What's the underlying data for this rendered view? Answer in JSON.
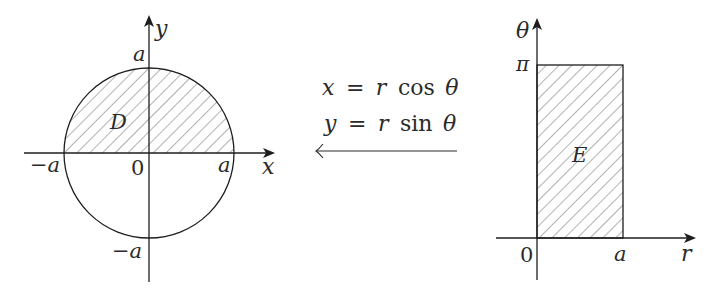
{
  "left_diagram": {
    "region_label": "D",
    "x_axis_label": "x",
    "y_axis_label": "y",
    "origin_label": "0",
    "tick_labels": {
      "x_pos": "a",
      "x_neg": "−a",
      "y_pos": "a",
      "y_neg": "−a"
    },
    "description": "Disk of radius a centered at origin; upper half (y ≥ 0) shaded"
  },
  "transform": {
    "eq1": {
      "lhs": "x",
      "rhs_var": "r",
      "func": "cos",
      "angle": "θ"
    },
    "eq2": {
      "lhs": "y",
      "rhs_var": "r",
      "func": "sin",
      "angle": "θ"
    },
    "equals": "=",
    "arrow_direction": "left"
  },
  "right_diagram": {
    "region_label": "E",
    "x_axis_label": "r",
    "y_axis_label": "θ",
    "origin_label": "0",
    "tick_labels": {
      "r_max": "a",
      "theta_max": "π"
    },
    "description": "Rectangle 0 ≤ r ≤ a, 0 ≤ θ ≤ π, shaded"
  },
  "colors": {
    "stroke": "#1e1e1e",
    "hatch": "#555555",
    "background": "#ffffff"
  }
}
